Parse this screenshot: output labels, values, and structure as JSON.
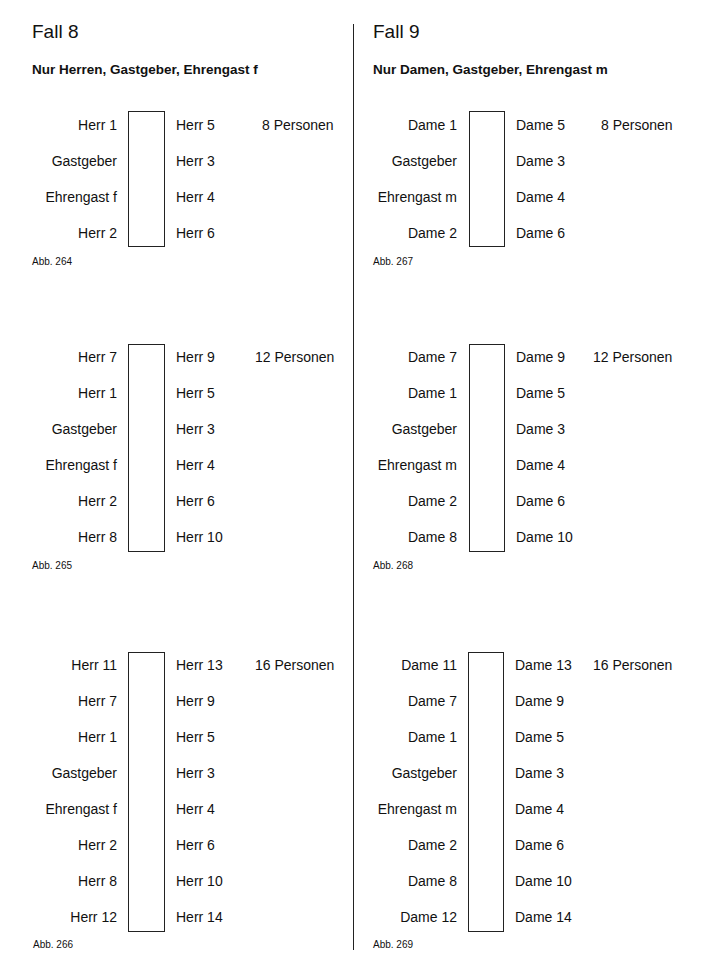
{
  "fall8": {
    "title": "Fall 8",
    "subtitle": "Nur Herren, Gastgeber, Ehrengast f",
    "diagrams": [
      {
        "count": "8 Personen",
        "figure": "Abb. 264",
        "left": [
          "Herr 1",
          "Gastgeber",
          "Ehrengast f",
          "Herr 2"
        ],
        "right": [
          "Herr 5",
          "Herr 3",
          "Herr 4",
          "Herr 6"
        ]
      },
      {
        "count": "12 Personen",
        "figure": "Abb. 265",
        "left": [
          "Herr 7",
          "Herr 1",
          "Gastgeber",
          "Ehrengast f",
          "Herr 2",
          "Herr 8"
        ],
        "right": [
          "Herr 9",
          "Herr 5",
          "Herr 3",
          "Herr 4",
          "Herr 6",
          "Herr 10"
        ]
      },
      {
        "count": "16 Personen",
        "figure": "Abb. 266",
        "left": [
          "Herr 11",
          "Herr 7",
          "Herr 1",
          "Gastgeber",
          "Ehrengast f",
          "Herr 2",
          "Herr 8",
          "Herr 12"
        ],
        "right": [
          "Herr 13",
          "Herr 9",
          "Herr 5",
          "Herr 3",
          "Herr 4",
          "Herr 6",
          "Herr 10",
          "Herr 14"
        ]
      }
    ]
  },
  "fall9": {
    "title": "Fall 9",
    "subtitle": "Nur Damen, Gastgeber, Ehrengast m",
    "diagrams": [
      {
        "count": "8 Personen",
        "figure": "Abb. 267",
        "left": [
          "Dame 1",
          "Gastgeber",
          "Ehrengast m",
          "Dame 2"
        ],
        "right": [
          "Dame 5",
          "Dame 3",
          "Dame 4",
          "Dame 6"
        ]
      },
      {
        "count": "12 Personen",
        "figure": "Abb. 268",
        "left": [
          "Dame 7",
          "Dame 1",
          "Gastgeber",
          "Ehrengast m",
          "Dame 2",
          "Dame 8"
        ],
        "right": [
          "Dame 9",
          "Dame 5",
          "Dame 3",
          "Dame 4",
          "Dame 6",
          "Dame 10"
        ]
      },
      {
        "count": "16 Personen",
        "figure": "Abb. 269",
        "left": [
          "Dame 11",
          "Dame 7",
          "Dame 1",
          "Gastgeber",
          "Ehrengast m",
          "Dame 2",
          "Dame 8",
          "Dame 12"
        ],
        "right": [
          "Dame 13",
          "Dame 9",
          "Dame 5",
          "Dame 3",
          "Dame 4",
          "Dame 6",
          "Dame 10",
          "Dame 14"
        ]
      }
    ]
  }
}
